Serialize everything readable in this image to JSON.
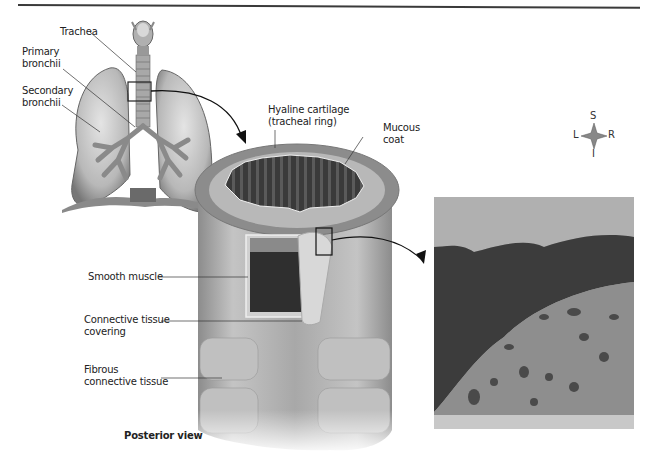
{
  "figure": {
    "title_view": "Posterior view",
    "labels": {
      "trachea": "Trachea",
      "primary_bronchii": "Primary\nbronchii",
      "secondary_bronchii": "Secondary\nbronchii",
      "hyaline_cartilage": "Hyaline cartilage\n(tracheal ring)",
      "mucous_coat": "Mucous\ncoat",
      "smooth_muscle": "Smooth muscle",
      "connective_tissue_covering": "Connective tissue\ncovering",
      "fibrous_connective_tissue": "Fibrous\nconnective tissue"
    },
    "orientation": {
      "superior": "S",
      "inferior": "I",
      "left": "L",
      "right": "R"
    },
    "panels": [
      {
        "id": "lungs",
        "description": "Lungs with trachea and bronchial tree, boxed region of trachea"
      },
      {
        "id": "trachea-section",
        "description": "Cutaway of trachea showing rings and layers"
      },
      {
        "id": "micrograph",
        "description": "Micrograph of hyaline cartilage and mucous coat"
      }
    ],
    "colors": {
      "ink": "#222222",
      "tissue_light": "#c8c8c8",
      "tissue_mid": "#9a9a9a",
      "tissue_dark": "#3c3c3c",
      "ring": "#8a8a8a"
    }
  }
}
